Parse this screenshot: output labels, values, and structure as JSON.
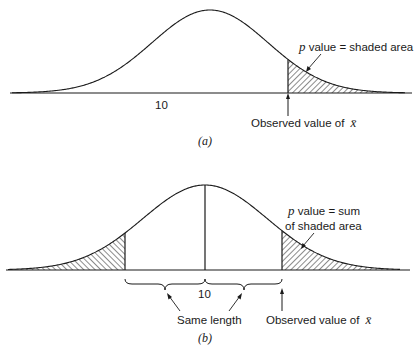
{
  "panel_a": {
    "center_label": "10",
    "p_symbol": "p",
    "p_label_rest": " value = shaded area",
    "observed_label": "Observed value of ",
    "xbar_symbol": "x̄",
    "caption": "(a)"
  },
  "panel_b": {
    "center_label": "10",
    "p_symbol": "p",
    "p_label_line1_rest": " value = sum",
    "p_label_line2": "of shaded area",
    "same_length_label": "Same length",
    "observed_label": "Observed value of ",
    "xbar_symbol": "x̄",
    "caption": "(b)"
  },
  "colors": {
    "ink": "#1a1a1a",
    "background": "#ffffff"
  }
}
